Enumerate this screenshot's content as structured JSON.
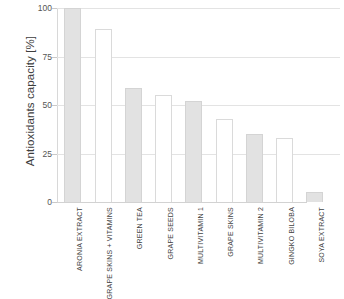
{
  "chart_data": {
    "type": "bar",
    "title": "",
    "subtitle": "",
    "xlabel": "",
    "ylabel": "Antioxidants capacity [%]",
    "ylim": [
      0,
      100
    ],
    "yticks": [
      0,
      25,
      50,
      75,
      100
    ],
    "ytick_labels": [
      "0",
      "25",
      "50",
      "75",
      "100"
    ],
    "grid": true,
    "legend": false,
    "legend_position": "none",
    "categories": [
      "ARONIA EXTRACT",
      "GRAPE SKINS + VITAMINS",
      "GREEN TEA",
      "GRAPE SEEDS",
      "MULTIVITAMIN 1",
      "GRAPE SKINS",
      "MULTIVITAMIN 2",
      "GINGKO BILOBA",
      "SOYA EXTRACT"
    ],
    "values": [
      100,
      89,
      59,
      55,
      52,
      43,
      35,
      33,
      5
    ],
    "bar_styles": [
      "filled",
      "open",
      "filled",
      "open",
      "filled",
      "open",
      "filled",
      "open",
      "filled"
    ],
    "colors": {
      "bar_fill": "#e2e2e2",
      "bar_edge": "#d4d4d4",
      "open_bar_fill": "#ffffff",
      "open_bar_edge": "#dadada",
      "gridline": "#e3e3e3",
      "axis": "#d8d8d8",
      "text": "#3d3d3d",
      "background": "#ffffff"
    }
  }
}
